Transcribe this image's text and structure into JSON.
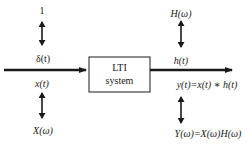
{
  "diagram": {
    "type": "block-diagram",
    "colors": {
      "stroke": "#1a1a1a",
      "background": "#ffffff"
    },
    "block": {
      "line1": "LTI",
      "line2": "system"
    },
    "left": {
      "top_label": "1",
      "impulse_label": "δ(t)",
      "input_label": "x(t)",
      "spectrum_label": "X(ω)"
    },
    "right": {
      "top_label": "H(ω)",
      "impulse_response_label": "h(t)",
      "output_label": "y(t)=x(t) ∗ h(t)",
      "spectrum_label": "Y(ω)=X(ω)H(ω)"
    }
  }
}
